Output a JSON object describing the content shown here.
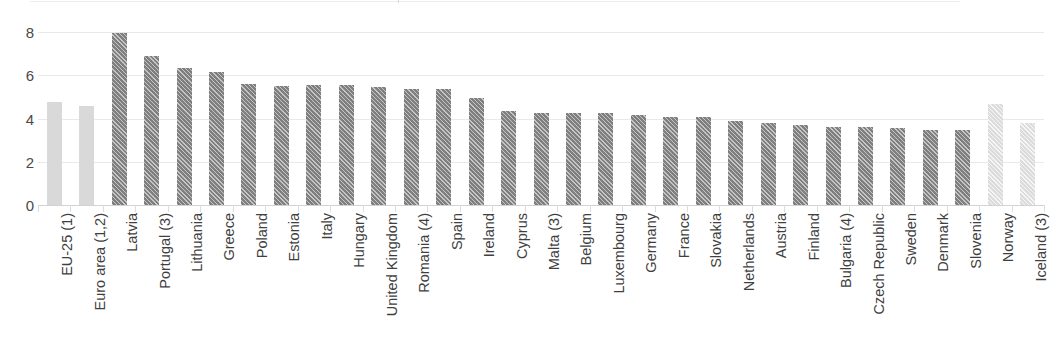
{
  "chart_data": {
    "type": "bar",
    "title": "",
    "subtitle": "",
    "xlabel": "",
    "ylabel": "",
    "ylim": [
      0,
      8
    ],
    "yticks": [
      0,
      2,
      4,
      6,
      8
    ],
    "ytick_labels": [
      "0",
      "2",
      "4",
      "6",
      "8"
    ],
    "grid": true,
    "legend": "none",
    "orientation": "vertical",
    "categories": [
      "EU-25 (1)",
      "Euro area (1,2)",
      "Latvia",
      "Portugal (3)",
      "Lithuania",
      "Greece",
      "Poland",
      "Estonia",
      "Italy",
      "Hungary",
      "United Kingdom",
      "Romania (4)",
      "Spain",
      "Ireland",
      "Cyprus",
      "Malta (3)",
      "Belgium",
      "Luxembourg",
      "Germany",
      "France",
      "Slovakia",
      "Netherlands",
      "Austria",
      "Finland",
      "Bulgaria (4)",
      "Czech Republic",
      "Sweden",
      "Denmark",
      "Slovenia",
      "Norway",
      "Iceland (3)"
    ],
    "values": [
      4.75,
      4.6,
      7.95,
      6.9,
      6.35,
      6.15,
      5.6,
      5.5,
      5.55,
      5.55,
      5.45,
      5.35,
      5.35,
      4.95,
      4.35,
      4.25,
      4.25,
      4.25,
      4.15,
      4.05,
      4.05,
      3.9,
      3.8,
      3.7,
      3.6,
      3.6,
      3.55,
      3.45,
      3.45,
      4.65,
      3.8
    ],
    "styles": [
      "solid-light",
      "solid-light",
      "hatch-dark",
      "hatch-dark",
      "hatch-dark",
      "hatch-dark",
      "hatch-dark",
      "hatch-dark",
      "hatch-dark",
      "hatch-dark",
      "hatch-dark",
      "hatch-dark",
      "hatch-dark",
      "hatch-dark",
      "hatch-dark",
      "hatch-dark",
      "hatch-dark",
      "hatch-dark",
      "hatch-dark",
      "hatch-dark",
      "hatch-dark",
      "hatch-dark",
      "hatch-dark",
      "hatch-dark",
      "hatch-dark",
      "hatch-dark",
      "hatch-dark",
      "hatch-dark",
      "hatch-dark",
      "hatch-light",
      "hatch-light"
    ],
    "colors": {
      "aggregate_bar": "#d9d9d9",
      "member_bar": "#7f7f7f",
      "nonmember_bar": "#dcdcdc",
      "gridline": "#e9e9ed",
      "axis": "#d2d2d6",
      "text": "#3f3f3f"
    }
  }
}
